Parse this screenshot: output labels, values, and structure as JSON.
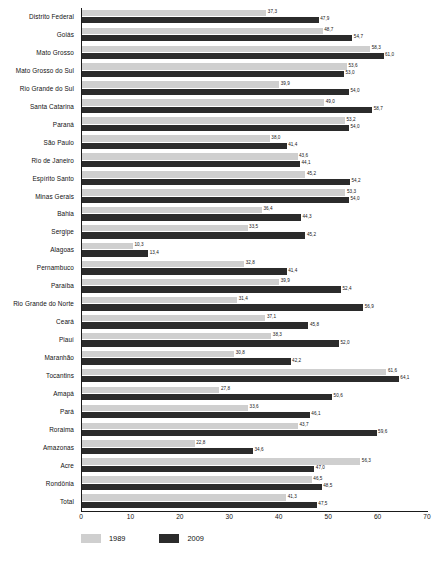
{
  "chart_data": {
    "type": "bar",
    "orientation": "horizontal",
    "title": "",
    "xlabel": "",
    "ylabel": "",
    "xlim": [
      0,
      70
    ],
    "xticks": [
      0,
      10,
      20,
      30,
      40,
      50,
      60,
      70
    ],
    "grid": false,
    "legend_position": "bottom-left",
    "categories": [
      "Distrito Federal",
      "Goiás",
      "Mato Grosso",
      "Mato Grosso do Sul",
      "Rio Grande do Sul",
      "Santa Catarina",
      "Paraná",
      "São Paulo",
      "Rio de Janeiro",
      "Espírito Santo",
      "Minas Gerais",
      "Bahia",
      "Sergipe",
      "Alagoas",
      "Pernambuco",
      "Paraíba",
      "Rio Grande do Norte",
      "Ceará",
      "Piauí",
      "Maranhão",
      "Tocantins",
      "Amapá",
      "Pará",
      "Roraima",
      "Amazonas",
      "Acre",
      "Rondônia",
      "Total"
    ],
    "series": [
      {
        "name": "1989",
        "color": "#cfcfcf",
        "values": [
          37.3,
          48.7,
          58.3,
          53.6,
          39.9,
          49.0,
          53.2,
          38.0,
          43.6,
          45.2,
          53.3,
          36.4,
          33.5,
          10.3,
          32.8,
          39.9,
          31.4,
          37.1,
          38.3,
          30.8,
          61.6,
          27.8,
          33.6,
          43.7,
          22.8,
          56.3,
          46.5,
          41.3
        ],
        "labels": [
          "37,3",
          "48,7",
          "58,3",
          "53,6",
          "39,9",
          "49,0",
          "53,2",
          "38,0",
          "43,6",
          "45,2",
          "53,3",
          "36,4",
          "33,5",
          "10,3",
          "32,8",
          "39,9",
          "31,4",
          "37,1",
          "38,3",
          "30,8",
          "61,6",
          "27,8",
          "33,6",
          "43,7",
          "22,8",
          "56,3",
          "46,5",
          "41,3"
        ]
      },
      {
        "name": "2009",
        "color": "#2b2b2b",
        "values": [
          47.9,
          54.7,
          61.0,
          53.0,
          54.0,
          58.7,
          54.0,
          41.4,
          44.1,
          54.2,
          54.0,
          44.3,
          45.2,
          13.4,
          41.4,
          52.4,
          56.9,
          45.8,
          52.0,
          42.2,
          64.1,
          50.6,
          46.1,
          59.6,
          34.6,
          47.0,
          48.5,
          47.5
        ],
        "labels": [
          "47,9",
          "54,7",
          "61,0",
          "53,0",
          "54,0",
          "58,7",
          "54,0",
          "41,4",
          "44,1",
          "54,2",
          "54,0",
          "44,3",
          "45,2",
          "13,4",
          "41,4",
          "52,4",
          "56,9",
          "45,8",
          "52,0",
          "42,2",
          "64,1",
          "50,6",
          "46,1",
          "59,6",
          "34,6",
          "47,0",
          "48,5",
          "47,5"
        ]
      }
    ],
    "xtick_labels": [
      "0",
      "10",
      "20",
      "30",
      "40",
      "50",
      "60",
      "70"
    ],
    "legend": [
      "1989",
      "2009"
    ]
  }
}
